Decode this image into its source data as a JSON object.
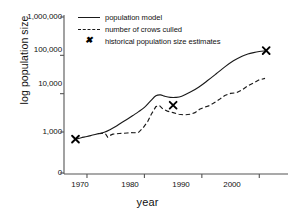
{
  "chart_data": {
    "type": "line",
    "title": "",
    "xlabel": "year",
    "ylabel": "log population size",
    "xlim": [
      1966,
      2005
    ],
    "ylim": [
      0,
      1000000
    ],
    "yscale": "log-style axis with 0 baseline",
    "grid": false,
    "legend_position": "top-center",
    "xticks": [
      1970,
      1980,
      1990,
      2000
    ],
    "xticklabels": [
      "1970",
      "1980",
      "1990",
      "2000"
    ],
    "yticks": [
      0,
      1000,
      10000,
      100000,
      1000000
    ],
    "yticklabels": [
      "0",
      "1,000",
      "10,000",
      "100,000",
      "1,000,000"
    ],
    "series": [
      {
        "name": "population model",
        "style": "solid",
        "color": "#1a1a1a",
        "x": [
          1968.0,
          1969.0,
          1970.0,
          1971.0,
          1972.0,
          1973.0,
          1974.0,
          1975.0,
          1976.0,
          1977.0,
          1978.0,
          1979.0,
          1980.0,
          1981.0,
          1982.0,
          1982.8,
          1983.5,
          1984.5,
          1985.5,
          1986.5,
          1988.0,
          1989.5,
          1991.0,
          1992.5,
          1994.0,
          1995.5,
          1997.0,
          1998.0,
          1999.0,
          2000.0,
          2001.0
        ],
        "y": [
          300,
          380,
          470,
          600,
          760,
          950,
          1150,
          1400,
          1750,
          2150,
          2700,
          3400,
          4400,
          6300,
          8800,
          9300,
          8600,
          8000,
          8000,
          8600,
          11000,
          15000,
          22000,
          33000,
          50000,
          72000,
          95000,
          108000,
          118000,
          126000,
          131000
        ]
      },
      {
        "name": "number of crows culled",
        "style": "dashed",
        "color": "#1a1a1a",
        "x": [
          1972.0,
          1972.6,
          1973.2,
          1973.6,
          1974.0,
          1974.5,
          1975.0,
          1975.6,
          1976.2,
          1977.0,
          1977.6,
          1978.2,
          1979.0,
          1979.8,
          1980.6,
          1981.2,
          1982.0,
          1982.6,
          1983.2,
          1984.0,
          1985.0,
          1986.0,
          1987.0,
          1988.0,
          1988.8,
          1989.6,
          1990.4,
          1991.2,
          1992.0,
          1993.0,
          1994.0,
          1995.0,
          1996.0,
          1997.0,
          1998.0,
          1999.0,
          2000.0,
          2001.0
        ],
        "y": [
          750,
          800,
          760,
          420,
          560,
          700,
          720,
          780,
          800,
          850,
          900,
          880,
          950,
          1300,
          1900,
          2900,
          4600,
          4900,
          4000,
          3500,
          3200,
          2900,
          2800,
          2900,
          3200,
          3900,
          4400,
          4800,
          5600,
          7000,
          9000,
          10200,
          10500,
          12500,
          16000,
          19000,
          23000,
          25000
        ]
      },
      {
        "name": "historical population size estimates",
        "style": "marker-x",
        "color": "#000000",
        "x": [
          1968.0,
          1985.0,
          2001.2
        ],
        "y": [
          300,
          5000,
          133000
        ]
      }
    ]
  },
  "legend": {
    "items": [
      {
        "label": "population model",
        "key": "solid-line-key"
      },
      {
        "label": "number of crows culled",
        "key": "dashed-line-key"
      },
      {
        "label": "historical population size estimates",
        "key": "x-marker-key"
      }
    ]
  },
  "axes": {
    "x_title": "year",
    "y_title": "log population size"
  }
}
